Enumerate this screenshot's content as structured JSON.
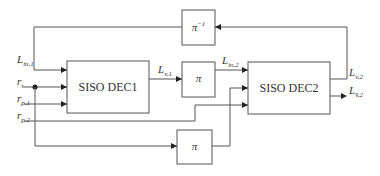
{
  "blocks": {
    "dec1": {
      "label": "SISO DEC1"
    },
    "dec2": {
      "label": "SISO DEC2"
    },
    "interleaver_mid": {
      "label": "π"
    },
    "interleaver_bottom": {
      "label": "π"
    },
    "deinterleaver": {
      "label": "π",
      "sup": "−1"
    }
  },
  "signals": {
    "l_in_1": {
      "base": "L",
      "sub": "in,1"
    },
    "r_s": {
      "base": "r",
      "sub": "s"
    },
    "r_p_1": {
      "base": "r",
      "sub": "p,1"
    },
    "r_p_2": {
      "base": "r",
      "sub": "p,2"
    },
    "l_v_1": {
      "base": "L",
      "sub": "v,1"
    },
    "l_in_2": {
      "base": "L",
      "sub": "in,2"
    },
    "l_v_2": {
      "base": "L",
      "sub": "v,2"
    },
    "l_vbar_2": {
      "base": "L",
      "sub": "v̄,2"
    }
  },
  "colors": {
    "line": "#555555",
    "text": "#333333",
    "background": "#ffffff"
  }
}
